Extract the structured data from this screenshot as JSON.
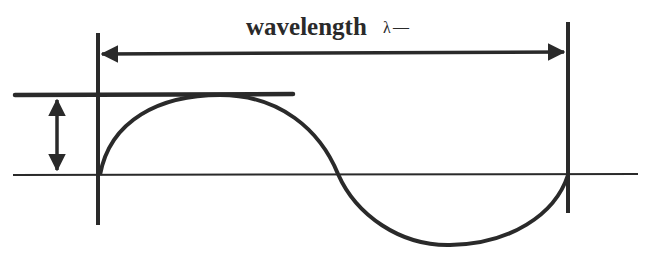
{
  "diagram": {
    "wavelength_label": "wavelength",
    "wavelength_symbol": "λ",
    "wavelength_trailing": "—",
    "colors": {
      "stroke": "#2a2a2a",
      "background": "#ffffff"
    },
    "elements": [
      "baseline",
      "sine-wave",
      "left-boundary-line",
      "right-boundary-line",
      "wavelength-double-arrow",
      "crest-reference-line",
      "amplitude-double-arrow"
    ]
  }
}
